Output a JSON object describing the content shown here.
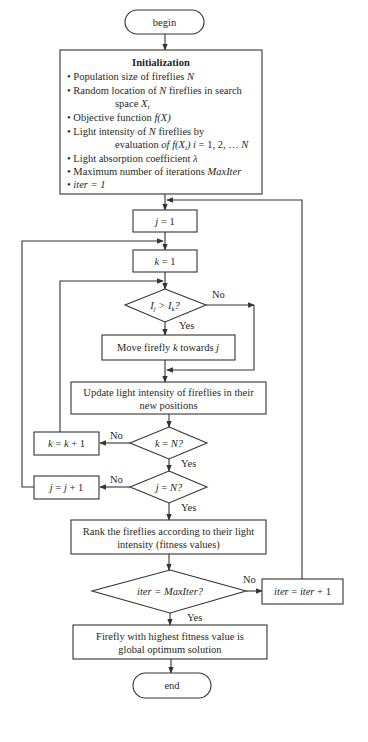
{
  "diagram": {
    "type": "flowchart",
    "nodes": {
      "begin": {
        "label": "begin"
      },
      "init": {
        "title": "Initialization",
        "items": [
          {
            "bullet": "•",
            "text": "Population size of fireflies ",
            "var": "N"
          },
          {
            "bullet": "•",
            "text": "Random location of ",
            "var": "N",
            "text2": " fireflies in search",
            "cont": "space ",
            "cont_var": "X",
            "cont_sub": "i"
          },
          {
            "bullet": "•",
            "text": "Objective function ",
            "var": "f(X)"
          },
          {
            "bullet": "•",
            "text": "Light intensity of ",
            "var": "N",
            "text2": " fireflies by",
            "cont": "evaluation ",
            "cont_var": "of f(X",
            "cont_sub": "i",
            "cont_tail": ") i",
            "cont_end": " = 1, 2, … ",
            "cont_end_var": "N"
          },
          {
            "bullet": "•",
            "text": "Light absorption coefficient ",
            "var": "λ"
          },
          {
            "bullet": "•",
            "text": "Maximum number of iterations ",
            "var": "MaxIter"
          },
          {
            "bullet": "•",
            "var": "iter = 1"
          }
        ]
      },
      "j_init": {
        "var": "j",
        "text": " = 1"
      },
      "k_init": {
        "var": "k",
        "text": " = 1"
      },
      "compare": {
        "I": "I",
        "sub_j": "j",
        "op": " > ",
        "sub_k": "k",
        "q": "?"
      },
      "move": {
        "text": "Move firefly ",
        "var_k": "k",
        "mid": " towards ",
        "var_j": "j"
      },
      "update": {
        "line1": "Update light intensity of fireflies in their",
        "line2": "new positions"
      },
      "k_check": {
        "var": "k",
        "text": " = ",
        "var2": "N?"
      },
      "k_inc": {
        "var": "k",
        "text": " = ",
        "var2": "k",
        "text2": " + 1"
      },
      "j_check": {
        "var": "j",
        "text": " = ",
        "var2": "N?"
      },
      "j_inc": {
        "var": "j",
        "text": " = ",
        "var2": "j",
        "text2": " + 1"
      },
      "rank": {
        "line1": "Rank the fireflies according to their light",
        "line2": "intensity (fitness values)"
      },
      "iter_check": {
        "text": "iter = MaxIter?"
      },
      "iter_inc": {
        "var": "iter",
        "text": " = ",
        "var2": "iter",
        "text2": " + 1"
      },
      "result": {
        "line1": "Firefly with highest fitness value is",
        "line2": "global optimum solution"
      },
      "end": {
        "label": "end"
      }
    },
    "edge_labels": {
      "compare_no": "No",
      "compare_yes": "Yes",
      "k_check_no": "No",
      "k_check_yes": "Yes",
      "j_check_no": "No",
      "j_check_yes": "Yes",
      "iter_check_no": "No",
      "iter_check_yes": "Yes"
    },
    "colors": {
      "stroke": "#333333",
      "text": "#1f1f1f",
      "background": "#ffffff"
    }
  }
}
